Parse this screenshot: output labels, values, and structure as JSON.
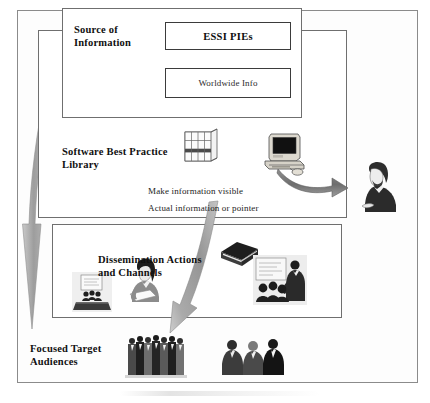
{
  "diagram": {
    "panels": [
      {
        "id": "source",
        "label": "Source of\nInformation"
      },
      {
        "id": "library",
        "label": "Software Best Practice\nLibrary"
      },
      {
        "id": "dissem",
        "label": "Dissemination Actions\nand Channels"
      },
      {
        "id": "audience",
        "label": "Focused Target\nAudiences"
      }
    ],
    "boxes": [
      {
        "id": "essi",
        "label": "ESSI PIEs"
      },
      {
        "id": "worldwide",
        "label": "Worldwide Info"
      }
    ],
    "captions": [
      {
        "id": "visible",
        "text": "Make information visible"
      },
      {
        "id": "pointer",
        "text": "Actual information or pointer"
      }
    ],
    "artwork": [
      {
        "id": "shelf",
        "name": "bookshelf-icon"
      },
      {
        "id": "computer",
        "name": "desktop-computer-icon"
      },
      {
        "id": "reader",
        "name": "person-reading-icon"
      },
      {
        "id": "book",
        "name": "book-icon"
      },
      {
        "id": "seminar",
        "name": "seminar-presentation-icon"
      },
      {
        "id": "woman",
        "name": "person-with-document-icon"
      },
      {
        "id": "class",
        "name": "classroom-training-icon"
      },
      {
        "id": "crowd",
        "name": "crowd-of-people-icon"
      },
      {
        "id": "trio",
        "name": "three-seated-people-icon"
      }
    ],
    "arrows": [
      {
        "id": "down-big",
        "name": "large-downward-flow-arrow"
      },
      {
        "id": "curve-big",
        "name": "curved-dissemination-arrow"
      },
      {
        "id": "to-reader",
        "name": "computer-to-reader-arrow"
      }
    ],
    "colors": {
      "arrow_fill": "#9a9a9a",
      "frame_border": "#8b8b8b",
      "panel_border": "#6f6f6f",
      "box_border": "#3b3b3b",
      "text": "#101010",
      "background": "#ffffff"
    }
  }
}
